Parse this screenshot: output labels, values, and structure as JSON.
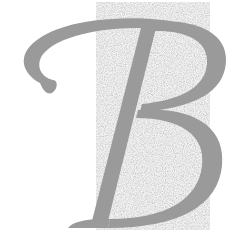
{
  "image": {
    "letter": "B",
    "description": "Decorative italic serif capital letter B on speckled gray texture",
    "colors": {
      "background": "#ffffff",
      "letter": "#9a9a9a",
      "texture": "#e4e4e4"
    }
  }
}
